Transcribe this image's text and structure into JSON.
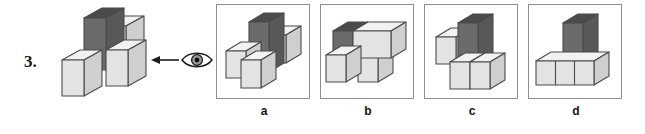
{
  "question": {
    "number": "3.",
    "type": "mental-rotation / view-identification",
    "prompt_visual": "Which view of the block figure is seen from the eye's direction?"
  },
  "stem": {
    "name": "reference-block-figure",
    "description": "Isometric arrangement: one tall dark vertical block standing on a base of light cubes, one light cube behind-right, two light cubes in front forming an L",
    "viewer": {
      "icon": "eye-icon",
      "arrow_icon": "left-arrow-icon",
      "direction": "left",
      "label": ""
    }
  },
  "options": [
    {
      "id": "a",
      "label": "a",
      "description": "Tall dark block upright at center-rear; light cube to its right at mid height; two light cubes in front-left forming an L at base"
    },
    {
      "id": "b",
      "label": "b",
      "description": "Long light block lying horizontally with a dark cube at its left end; a light cube below-left and one light cube beneath at right"
    },
    {
      "id": "c",
      "label": "c",
      "description": "Tall dark block upright at center; one light cube to the upper-left; two light cubes side by side at the base-right"
    },
    {
      "id": "d",
      "label": "d",
      "description": "Tall dark block upright at center standing on a row of three light cubes forming a T shape"
    }
  ],
  "colors": {
    "dark_front": "#6b6b6b",
    "dark_side": "#585858",
    "dark_top": "#4b4b4b",
    "light_front": "#e3e3e3",
    "light_side": "#cfcfcf",
    "light_top": "#f2f2f2",
    "outline": "#4a4a4a",
    "frame_border": "#8e8e8e",
    "text": "#141414",
    "page_background": "#ffffff"
  }
}
